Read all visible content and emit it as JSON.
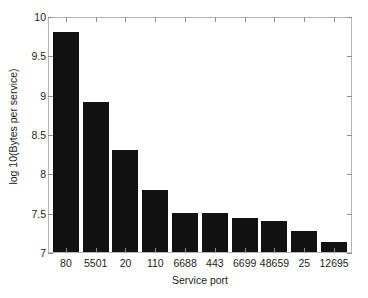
{
  "chart_data": {
    "type": "bar",
    "title": "",
    "subtitle": "",
    "xlabel": "Service port",
    "ylabel": "log 10(Bytes per service)",
    "categories": [
      "80",
      "5501",
      "20",
      "110",
      "6688",
      "443",
      "6699",
      "48659",
      "25",
      "12695"
    ],
    "values": [
      9.8,
      8.91,
      8.3,
      7.79,
      7.5,
      7.49,
      7.43,
      7.39,
      7.27,
      7.13
    ],
    "ylim": [
      7,
      10
    ],
    "yticks": [
      7,
      7.5,
      8,
      8.5,
      9,
      9.5,
      10
    ],
    "ytick_labels": [
      "7",
      "7.5",
      "8",
      "8.5",
      "9",
      "9.5",
      "10"
    ],
    "grid": false,
    "legend": null,
    "legend_position": "none",
    "bar_color": "#111111",
    "axis_color": "#b4b4b4",
    "background_color": "#ffffff",
    "text_color": "#1c1c1c"
  }
}
